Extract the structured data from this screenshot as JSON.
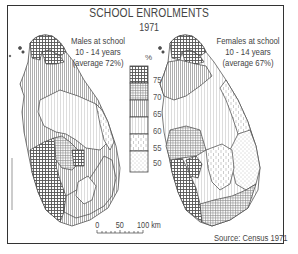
{
  "title": "SCHOOL ENROLMENTS",
  "year": "1971",
  "maps": [
    {
      "id": "males",
      "caption_lines": [
        "Males at school",
        "10 - 14 years",
        "(average 72%)"
      ],
      "average": 72
    },
    {
      "id": "females",
      "caption_lines": [
        "Females at school",
        "10 - 14 years",
        "(average 67%)"
      ],
      "average": 67
    }
  ],
  "legend": {
    "unit": "%",
    "ticks": [
      "75",
      "70",
      "65",
      "60",
      "55",
      "50"
    ],
    "classes": [
      {
        "range": "over 75",
        "pattern": "dense-crosshatch"
      },
      {
        "range": "70-75",
        "pattern": "fine-crosshatch"
      },
      {
        "range": "65-70",
        "pattern": "dense-vertical-lines"
      },
      {
        "range": "60-65",
        "pattern": "light-vertical-lines"
      },
      {
        "range": "55-60",
        "pattern": "dashed-vertical-lines"
      },
      {
        "range": "under 55",
        "pattern": "dots"
      }
    ]
  },
  "scale_bar": {
    "labels": [
      "0",
      "50",
      "100 km"
    ]
  },
  "source": "Source:  Census 1971",
  "colors": {
    "ink": "#333333",
    "background": "#ffffff"
  }
}
